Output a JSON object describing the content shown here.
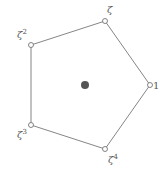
{
  "diagram": {
    "center": {
      "x": 85,
      "y": 85,
      "color": "#555555"
    },
    "edge_color": "#666666",
    "vertices": [
      {
        "label": "1",
        "x": 150,
        "y": 85
      },
      {
        "label": "ζ",
        "x": 105,
        "y": 21
      },
      {
        "label": "ζ²",
        "x": 31,
        "y": 45
      },
      {
        "label": "ζ³",
        "x": 31,
        "y": 125
      },
      {
        "label": "ζ⁴",
        "x": 105,
        "y": 149
      }
    ],
    "labels": {
      "v0": "1",
      "v1": "ζ",
      "v2": "ζ2",
      "v3": "ζ3",
      "v4": "ζ4",
      "v2_base": "ζ",
      "v2_exp": "2",
      "v3_base": "ζ",
      "v3_exp": "3",
      "v4_base": "ζ",
      "v4_exp": "4"
    }
  }
}
